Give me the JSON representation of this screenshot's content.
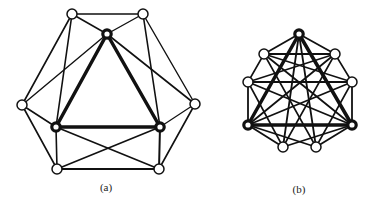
{
  "figure": {
    "panels": [
      {
        "label": "(a)",
        "label_pos": [
          106,
          181
        ],
        "nodes": [
          {
            "id": "top",
            "x": 107,
            "y": 34,
            "bold": true
          },
          {
            "id": "tl",
            "x": 72,
            "y": 14,
            "bold": false
          },
          {
            "id": "tr",
            "x": 143,
            "y": 14,
            "bold": false
          },
          {
            "id": "l",
            "x": 22,
            "y": 105,
            "bold": false
          },
          {
            "id": "r",
            "x": 195,
            "y": 104,
            "bold": false
          },
          {
            "id": "blt",
            "x": 56,
            "y": 127,
            "bold": true
          },
          {
            "id": "brt",
            "x": 160,
            "y": 127,
            "bold": true
          },
          {
            "id": "bl",
            "x": 57,
            "y": 169,
            "bold": false
          },
          {
            "id": "br",
            "x": 159,
            "y": 169,
            "bold": false
          }
        ],
        "edges": [
          [
            "top",
            "blt",
            3.5
          ],
          [
            "top",
            "brt",
            3.5
          ],
          [
            "blt",
            "brt",
            3.5
          ],
          [
            "tl",
            "tr",
            1.6
          ],
          [
            "tl",
            "top",
            1.6
          ],
          [
            "tr",
            "top",
            1.4
          ],
          [
            "tl",
            "l",
            1.6
          ],
          [
            "tl",
            "blt",
            1.6
          ],
          [
            "tr",
            "r",
            1.4
          ],
          [
            "tr",
            "brt",
            1.6
          ],
          [
            "l",
            "top",
            1.4
          ],
          [
            "r",
            "top",
            1.6
          ],
          [
            "l",
            "blt",
            1.6
          ],
          [
            "l",
            "bl",
            1.6
          ],
          [
            "r",
            "brt",
            1.2
          ],
          [
            "r",
            "br",
            1.6
          ],
          [
            "blt",
            "bl",
            1.6
          ],
          [
            "brt",
            "br",
            2.0
          ],
          [
            "blt",
            "br",
            1.6
          ],
          [
            "brt",
            "bl",
            1.6
          ],
          [
            "bl",
            "br",
            1.8
          ]
        ]
      },
      {
        "label": "(b)",
        "label_pos": [
          299,
          183
        ],
        "nodes": [
          {
            "id": "top",
            "x": 299,
            "y": 34,
            "bold": true
          },
          {
            "id": "ul",
            "x": 264,
            "y": 54,
            "bold": false
          },
          {
            "id": "ur",
            "x": 335,
            "y": 54,
            "bold": false
          },
          {
            "id": "ml",
            "x": 248,
            "y": 82,
            "bold": false
          },
          {
            "id": "mr",
            "x": 352,
            "y": 82,
            "bold": false
          },
          {
            "id": "blt",
            "x": 248,
            "y": 125,
            "bold": true
          },
          {
            "id": "brt",
            "x": 352,
            "y": 125,
            "bold": true
          },
          {
            "id": "bll",
            "x": 283,
            "y": 147,
            "bold": false
          },
          {
            "id": "blr",
            "x": 316,
            "y": 147,
            "bold": false
          }
        ],
        "edges": [
          [
            "top",
            "blt",
            3.5
          ],
          [
            "top",
            "brt",
            3.5
          ],
          [
            "blt",
            "brt",
            3.5
          ],
          [
            "top",
            "ul",
            1.8
          ],
          [
            "top",
            "ur",
            1.8
          ],
          [
            "ul",
            "ur",
            1.8
          ],
          [
            "top",
            "bll",
            1.8
          ],
          [
            "top",
            "blr",
            1.8
          ],
          [
            "ul",
            "ml",
            1.6
          ],
          [
            "ur",
            "mr",
            1.6
          ],
          [
            "ul",
            "brt",
            1.8
          ],
          [
            "ur",
            "blt",
            1.8
          ],
          [
            "ul",
            "blr",
            1.6
          ],
          [
            "ur",
            "bll",
            1.6
          ],
          [
            "ml",
            "mr",
            1.8
          ],
          [
            "ml",
            "blt",
            1.8
          ],
          [
            "mr",
            "brt",
            1.8
          ],
          [
            "ml",
            "brt",
            1.8
          ],
          [
            "mr",
            "blt",
            1.8
          ],
          [
            "ml",
            "bll",
            1.6
          ],
          [
            "mr",
            "blr",
            1.6
          ],
          [
            "blt",
            "bll",
            1.8
          ],
          [
            "blt",
            "blr",
            1.8
          ],
          [
            "brt",
            "bll",
            1.8
          ],
          [
            "brt",
            "blr",
            1.8
          ],
          [
            "ml",
            "ur",
            1.4
          ],
          [
            "mr",
            "ul",
            1.4
          ]
        ]
      }
    ],
    "colors": {
      "stroke": "#111111",
      "node_fill": "#ffffff"
    }
  }
}
